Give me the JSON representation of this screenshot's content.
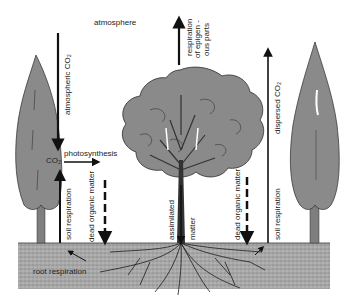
{
  "diagram": {
    "type": "carbon-cycle-forest",
    "colors": {
      "tree_fill": "#8a8a8a",
      "tree_outline": "#2a2a2a",
      "soil": "#a8a8a8",
      "arrow": "#111111",
      "background": "#ffffff"
    },
    "labels": {
      "atmosphere": "atmosphere",
      "atmospheric_co2": "atmospheric CO₂",
      "co2": "CO₂",
      "photosynthesis": "photosynthesis",
      "soil_respiration_left": "soil respiration",
      "dead_organic_matter_left": "dead organic matter",
      "root_respiration": "root respiration",
      "respiration": "respiration",
      "of_epigeous_line1": "of epigen -",
      "of_epigeous_line2": "ous parts",
      "assimilated": "assimilated",
      "matter": "matter",
      "dead_organic_matter_right": "dead organic matter",
      "dispersed_co2": "dispersed CO₂",
      "soil_respiration_right": "soil respiration"
    },
    "elements": [
      "left-cypress-tree",
      "central-deciduous-tree",
      "right-cypress-tree",
      "soil-layer",
      "root-system"
    ]
  }
}
